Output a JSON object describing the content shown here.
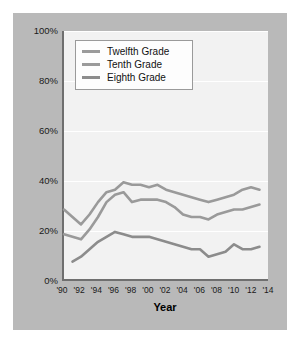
{
  "chart_data": {
    "type": "line",
    "title": "",
    "xlabel": "Year",
    "ylabel": "",
    "ylim": [
      0,
      100
    ],
    "xlim": [
      1990,
      2014
    ],
    "grid": true,
    "legend_position": "top-left",
    "ytick_labels": [
      "100%",
      "80%",
      "60%",
      "40%",
      "20%",
      "0%"
    ],
    "ytick_values": [
      100,
      80,
      60,
      40,
      20,
      0
    ],
    "xtick_labels": [
      "'90",
      "'92",
      "'94",
      "'96",
      "'98",
      "'00",
      "'02",
      "'04",
      "'06",
      "'08",
      "'10",
      "'12",
      "'14"
    ],
    "xtick_values": [
      1990,
      1992,
      1994,
      1996,
      1998,
      2000,
      2002,
      2004,
      2006,
      2008,
      2010,
      2012,
      2014
    ],
    "series": [
      {
        "name": "Twelfth Grade",
        "color": "#9a9a9a",
        "x": [
          1990,
          1991,
          1992,
          1993,
          1994,
          1995,
          1996,
          1997,
          1998,
          1999,
          2000,
          2001,
          2002,
          2003,
          2004,
          2005,
          2006,
          2007,
          2008,
          2009,
          2010,
          2011,
          2012,
          2013
        ],
        "values": [
          28,
          25,
          22,
          26,
          31,
          35,
          36,
          39,
          38,
          38,
          37,
          38,
          36,
          35,
          34,
          33,
          32,
          31,
          32,
          33,
          34,
          36,
          37,
          36
        ]
      },
      {
        "name": "Tenth Grade",
        "color": "#9a9a9a",
        "x": [
          1990,
          1991,
          1992,
          1993,
          1994,
          1995,
          1996,
          1997,
          1998,
          1999,
          2000,
          2001,
          2002,
          2003,
          2004,
          2005,
          2006,
          2007,
          2008,
          2009,
          2010,
          2011,
          2012,
          2013
        ],
        "values": [
          18,
          17,
          16,
          20,
          25,
          31,
          34,
          35,
          31,
          32,
          32,
          32,
          31,
          29,
          26,
          25,
          25,
          24,
          26,
          27,
          28,
          28,
          29,
          30
        ]
      },
      {
        "name": "Eighth Grade",
        "color": "#8c8c8c",
        "x": [
          1991,
          1992,
          1993,
          1994,
          1995,
          1996,
          1997,
          1998,
          1999,
          2000,
          2001,
          2002,
          2003,
          2004,
          2005,
          2006,
          2007,
          2008,
          2009,
          2010,
          2011,
          2012,
          2013
        ],
        "values": [
          7,
          9,
          12,
          15,
          17,
          19,
          18,
          17,
          17,
          17,
          16,
          15,
          14,
          13,
          12,
          12,
          9,
          10,
          11,
          14,
          12,
          12,
          13
        ]
      }
    ]
  },
  "legend": {
    "items": [
      {
        "label": "Twelfth Grade"
      },
      {
        "label": "Tenth Grade"
      },
      {
        "label": "Eighth Grade"
      }
    ]
  },
  "axis": {
    "x_title": "Year"
  }
}
